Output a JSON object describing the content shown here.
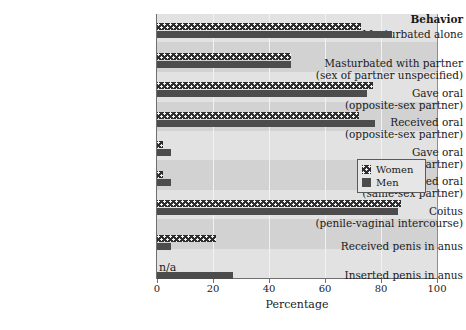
{
  "chart_data": {
    "type": "bar",
    "orientation": "horizontal",
    "title": "",
    "header_label": "Behavior",
    "xlabel": "Percentage",
    "ylabel": "",
    "xlim": [
      0,
      100
    ],
    "xticks": [
      0,
      20,
      40,
      60,
      80,
      100
    ],
    "xtick_labels": [
      "0",
      "20",
      "40",
      "60",
      "80",
      "100"
    ],
    "grid": true,
    "legend_position": "center-right",
    "categories": [
      "Masturbated alone",
      "Masturbated with partner\n(sex of partner unspecified)",
      "Gave oral\n(opposite-sex partner)",
      "Received oral\n(opposite-sex partner)",
      "Gave oral\n(same-sex partner)",
      "Received oral\n(same-sex partner)",
      "Coitus\n(penile-vaginal intercourse)",
      "Received penis in anus",
      "Inserted penis in anus"
    ],
    "category_lines": [
      [
        "Masturbated alone"
      ],
      [
        "Masturbated with partner",
        "(sex of partner unspecified)"
      ],
      [
        "Gave oral",
        "(opposite-sex partner)"
      ],
      [
        "Received oral",
        "(opposite-sex partner)"
      ],
      [
        "Gave oral",
        "(same-sex partner)"
      ],
      [
        "Received oral",
        "(same-sex partner)"
      ],
      [
        "Coitus",
        "(penile-vaginal intercourse)"
      ],
      [
        "Received penis in anus"
      ],
      [
        "Inserted penis in anus"
      ]
    ],
    "series": [
      {
        "name": "Women",
        "color": "#2e2e2e",
        "pattern": "dotted",
        "values": [
          73,
          48,
          77,
          72,
          2,
          2,
          87,
          21,
          null
        ],
        "null_label": "n/a"
      },
      {
        "name": "Men",
        "color": "#4c4c4c",
        "pattern": "solid",
        "values": [
          84,
          48,
          75,
          78,
          5,
          5,
          86,
          5,
          27
        ],
        "null_label": ""
      }
    ],
    "legend_entries": [
      "Women",
      "Men"
    ],
    "na_annotation": "n/a"
  },
  "colors": {
    "plot_background": "#d2d2d2",
    "band_background": "#e2e2e2",
    "gridline": "#f2f2f2",
    "axis": "#6f6f6f",
    "women_bar": "#2e2e2e",
    "men_bar": "#4c4c4c",
    "legend_background": "#e6e6e6",
    "legend_border": "#5a5a5a",
    "text": "#1a1a1a"
  }
}
